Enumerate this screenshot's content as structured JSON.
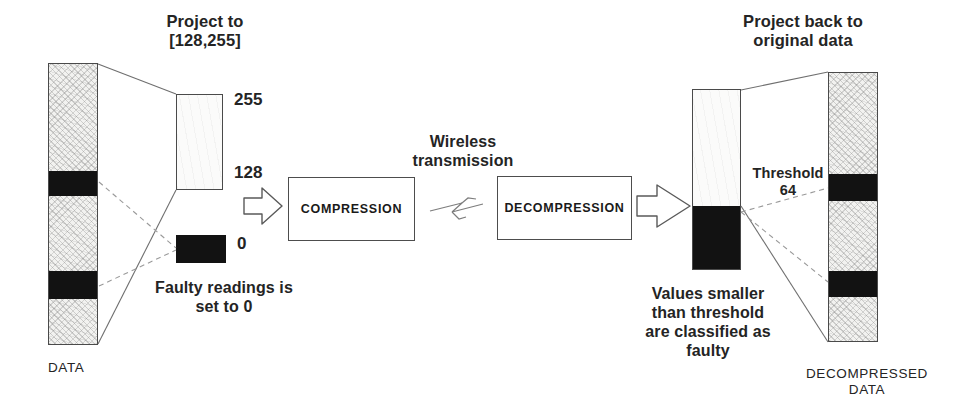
{
  "diagram": {
    "title_left": "Project to\n[128,255]",
    "title_right": "Project back to\noriginal data",
    "wireless_label": "Wireless\ntransmission",
    "faulty_note": "Faulty readings is\nset to 0",
    "threshold_note": "Threshold\n64",
    "values_note": "Values smaller\nthan threshold\nare classified as\nfaulty",
    "label_data": "DATA",
    "label_decompressed": "DECOMPRESSED\nDATA",
    "scale": {
      "max": "255",
      "mid": "128",
      "min": "0"
    },
    "process": {
      "compression": "COMPRESSION",
      "decompression": "DECOMPRESSION"
    },
    "colors": {
      "ink": "#1c1c1c",
      "outline": "#4a4a4a",
      "faulty_band": "#121212",
      "good_fill": "#f2f2f0",
      "background": "#ffffff",
      "dashed_connector": "#8a8a8a"
    },
    "bars": {
      "input_data": {
        "name": "DATA",
        "segments": [
          {
            "kind": "good",
            "from_pct": 0,
            "to_pct": 37.9
          },
          {
            "kind": "faulty",
            "from_pct": 37.9,
            "to_pct": 46.8
          },
          {
            "kind": "good",
            "from_pct": 46.8,
            "to_pct": 73.4
          },
          {
            "kind": "faulty",
            "from_pct": 73.4,
            "to_pct": 83.3
          },
          {
            "kind": "good",
            "from_pct": 83.3,
            "to_pct": 100
          }
        ]
      },
      "projected_range": {
        "name": "valid range box",
        "top_value": "255",
        "bottom_value": "128"
      },
      "zero_box": {
        "name": "faulty value box",
        "value": "0"
      },
      "threshold_bar": {
        "name": "received values with threshold",
        "threshold_value": "64",
        "above_threshold_pct": 64.1,
        "below_threshold_pct": 35.9
      },
      "output_data": {
        "name": "DECOMPRESSED DATA",
        "segments": [
          {
            "kind": "good",
            "from_pct": 0,
            "to_pct": 37.4
          },
          {
            "kind": "faulty",
            "from_pct": 37.4,
            "to_pct": 47.4
          },
          {
            "kind": "good",
            "from_pct": 47.4,
            "to_pct": 73.3
          },
          {
            "kind": "faulty",
            "from_pct": 73.3,
            "to_pct": 82.9
          },
          {
            "kind": "good",
            "from_pct": 82.9,
            "to_pct": 100
          }
        ]
      }
    },
    "flow": [
      "DATA",
      "Project to [128,255]",
      "COMPRESSION",
      "Wireless transmission",
      "DECOMPRESSION",
      "Project back to original data",
      "DECOMPRESSED DATA"
    ]
  }
}
